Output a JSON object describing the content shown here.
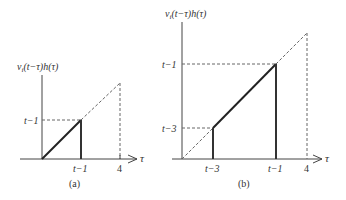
{
  "panel_a": {
    "caption": "(a)",
    "ylabel": "v_i(t−τ)h(τ)",
    "ylabel_parts": {
      "v": "v",
      "sub": "i",
      "rest": "(t−τ)h(τ)"
    },
    "xlabel": "τ",
    "ytick": "t−1",
    "xticks": [
      "t−1",
      "4"
    ]
  },
  "panel_b": {
    "caption": "(b)",
    "ylabel": "v_i(t−τ)h(τ)",
    "ylabel_parts": {
      "v": "v",
      "sub": "i",
      "rest": "(t−τ)h(τ)"
    },
    "xlabel": "τ",
    "yticks": [
      "t−1",
      "t−3"
    ],
    "xticks": [
      "t−3",
      "t−1",
      "4"
    ]
  },
  "colors": {
    "solid": "#333333",
    "dashed": "#666666",
    "text": "#333333"
  }
}
